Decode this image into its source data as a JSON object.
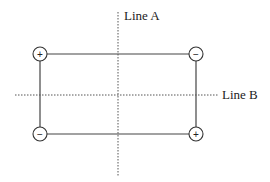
{
  "diagram": {
    "line_a": {
      "label": "Line A"
    },
    "line_b": {
      "label": "Line B"
    },
    "charges": [
      {
        "position": "top-left",
        "sign": "+"
      },
      {
        "position": "top-right",
        "sign": "−"
      },
      {
        "position": "bottom-left",
        "sign": "−"
      },
      {
        "position": "bottom-right",
        "sign": "+"
      }
    ]
  }
}
